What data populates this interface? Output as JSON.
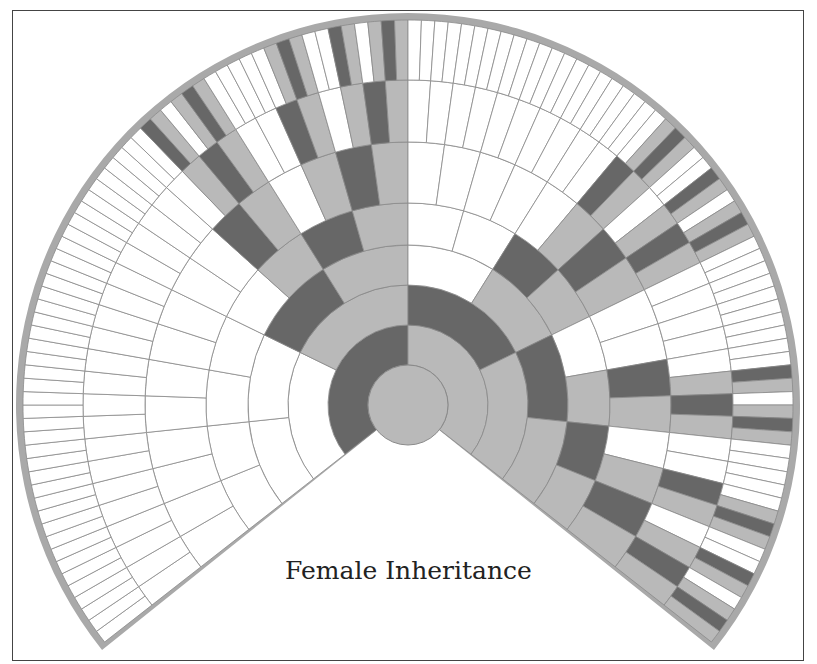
{
  "title": "Female Inheritance",
  "chart_data": {
    "type": "fan-chart",
    "title": "Female Inheritance",
    "root_sex": "female",
    "generations": 7,
    "ordering": "father then mother, clockwise",
    "legend": {
      "male_contributor": "dark gray",
      "female_contributor": "light gray",
      "no_contribution": "white"
    }
  },
  "geometry": {
    "cx": 408,
    "cy": 405,
    "radii": [
      40,
      80,
      120,
      160,
      202,
      263,
      325,
      385
    ],
    "border_width": 7,
    "gap_half_angle_deg": 52
  },
  "colors": {
    "male": "#676767",
    "female": "#b9b9b9",
    "none": "#ffffff",
    "border": "#a9a9a9",
    "line": "#8a8a8a"
  }
}
